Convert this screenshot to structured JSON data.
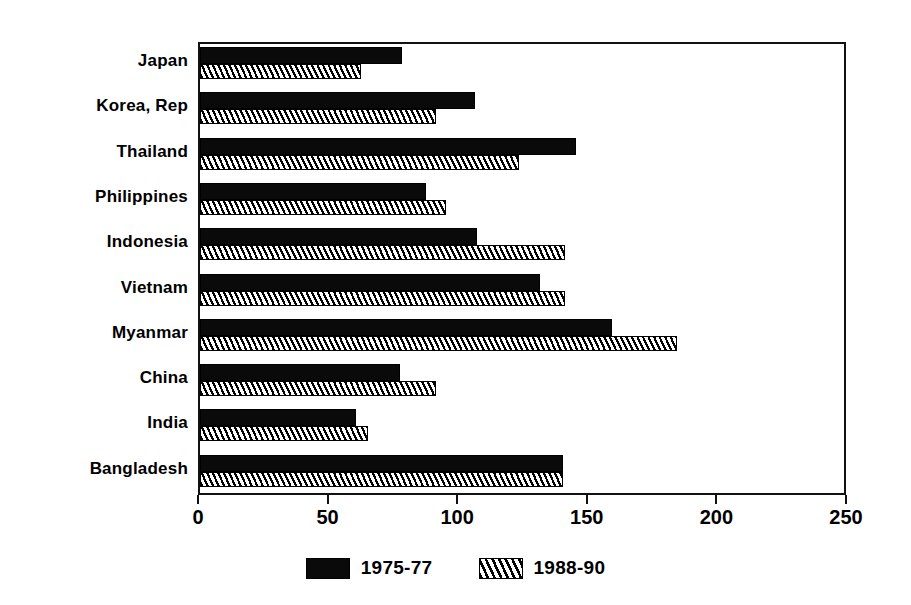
{
  "chart_data": {
    "type": "bar",
    "orientation": "horizontal",
    "title": "",
    "subtitle": "",
    "xlabel": "",
    "ylabel": "",
    "xlim": [
      0,
      250
    ],
    "ylim": null,
    "grid": false,
    "legend_position": "bottom-center",
    "xticks": [
      0,
      50,
      100,
      150,
      200,
      250
    ],
    "xticklabels": [
      "0",
      "50",
      "100",
      "150",
      "200",
      "250"
    ],
    "categories": [
      "Japan",
      "Korea, Rep",
      "Thailand",
      "Philippines",
      "Indonesia",
      "Vietnam",
      "Myanmar",
      "China",
      "India",
      "Bangladesh"
    ],
    "series": [
      {
        "name": "1975-77",
        "fill": "solid-black",
        "color": "#0a0a0a",
        "values": [
          78,
          106,
          145,
          87,
          107,
          131,
          159,
          77,
          60,
          140
        ]
      },
      {
        "name": "1988-90",
        "fill": "diagonal-hatch",
        "color": "#ffffff",
        "values": [
          62,
          91,
          123,
          95,
          141,
          141,
          184,
          91,
          65,
          140
        ]
      }
    ],
    "legend": [
      "1975-77",
      "1988-90"
    ]
  }
}
